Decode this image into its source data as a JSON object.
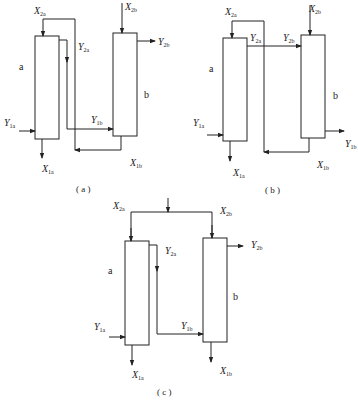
{
  "diagrams": {
    "a": {
      "caption": "( a )",
      "column_a": "a",
      "column_b": "b",
      "labels": {
        "X2a": {
          "main": "X",
          "sub": "2a"
        },
        "Y2a": {
          "main": "Y",
          "sub": "2a"
        },
        "X2b": {
          "main": "X",
          "sub": "2b"
        },
        "Y2b": {
          "main": "Y",
          "sub": "2b"
        },
        "Y1a": {
          "main": "Y",
          "sub": "1a"
        },
        "X1a": {
          "main": "X",
          "sub": "1a"
        },
        "Y1b": {
          "main": "Y",
          "sub": "1b"
        },
        "X1b": {
          "main": "X",
          "sub": "1b"
        }
      }
    },
    "b": {
      "caption": "( b )",
      "column_a": "a",
      "column_b": "b",
      "labels": {
        "X2a": {
          "main": "X",
          "sub": "2a"
        },
        "Y2a": {
          "main": "Y",
          "sub": "2a"
        },
        "Y2b": {
          "main": "Y",
          "sub": "2b"
        },
        "X2b": {
          "main": "X",
          "sub": "2b"
        },
        "Y1a": {
          "main": "Y",
          "sub": "1a"
        },
        "X1a": {
          "main": "X",
          "sub": "1a"
        },
        "Y1b": {
          "main": "Y",
          "sub": "1b"
        },
        "X1b": {
          "main": "X",
          "sub": "1b"
        }
      }
    },
    "c": {
      "caption": "( c )",
      "column_a": "a",
      "column_b": "b",
      "labels": {
        "X2a": {
          "main": "X",
          "sub": "2a"
        },
        "X2b": {
          "main": "X",
          "sub": "2b"
        },
        "Y2a": {
          "main": "Y",
          "sub": "2a"
        },
        "Y2b": {
          "main": "Y",
          "sub": "2b"
        },
        "Y1a": {
          "main": "Y",
          "sub": "1a"
        },
        "Y1b": {
          "main": "Y",
          "sub": "1b"
        },
        "X1a": {
          "main": "X",
          "sub": "1a"
        },
        "X1b": {
          "main": "X",
          "sub": "1b"
        }
      }
    }
  }
}
